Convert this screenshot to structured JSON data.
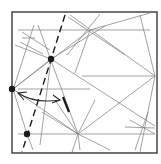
{
  "diagram": {
    "type": "origami-crease-pattern",
    "width": 161,
    "height": 164,
    "colors": {
      "background": "#ffffff",
      "border": "#3a3a3a",
      "crease": "#8a8a8a",
      "mark": "#1a1a1a"
    },
    "square": {
      "x": 12,
      "y": 12,
      "w": 145,
      "h": 141
    },
    "creases": [
      [
        18,
        30,
        150,
        30
      ],
      [
        18,
        89,
        90,
        89
      ],
      [
        82,
        76,
        155,
        76
      ],
      [
        18,
        134,
        155,
        134
      ],
      [
        22,
        38,
        35,
        38
      ],
      [
        22,
        32,
        50,
        50
      ],
      [
        20,
        42,
        43,
        54
      ],
      [
        34,
        25,
        13,
        90
      ],
      [
        38,
        25,
        78,
        134
      ],
      [
        70,
        15,
        155,
        76
      ],
      [
        90,
        30,
        75,
        73
      ],
      [
        100,
        14,
        67,
        55
      ],
      [
        90,
        30,
        150,
        13
      ],
      [
        68,
        17,
        125,
        55
      ],
      [
        13,
        89,
        90,
        30
      ],
      [
        13,
        89,
        78,
        134
      ],
      [
        51,
        59,
        155,
        126
      ],
      [
        13,
        89,
        51,
        59
      ],
      [
        51,
        59,
        40,
        145
      ],
      [
        15,
        45,
        51,
        59
      ],
      [
        51,
        59,
        105,
        26
      ],
      [
        13,
        89,
        27,
        134
      ],
      [
        27,
        134,
        33,
        150
      ],
      [
        78,
        134,
        155,
        76
      ],
      [
        78,
        134,
        110,
        150
      ],
      [
        78,
        134,
        55,
        100
      ],
      [
        78,
        134,
        80,
        150
      ],
      [
        78,
        134,
        72,
        152
      ],
      [
        78,
        134,
        42,
        112
      ],
      [
        78,
        134,
        95,
        100
      ],
      [
        140,
        15,
        155,
        76
      ],
      [
        155,
        76,
        140,
        152
      ],
      [
        130,
        120,
        155,
        134
      ],
      [
        148,
        112,
        135,
        150
      ],
      [
        125,
        127,
        155,
        128
      ]
    ],
    "dashed_line": [
      65,
      15,
      22,
      152
    ],
    "thick_segment": [
      63,
      97,
      69,
      112
    ],
    "arrow": {
      "path": "M 18 93 Q 35 104 60 100",
      "head_start": [
        18,
        93
      ],
      "head_end": [
        60,
        100
      ],
      "style": "double-headed-curved"
    },
    "dots": [
      {
        "name": "upper-reference-point",
        "cx": 51,
        "cy": 59,
        "r": 3.2
      },
      {
        "name": "left-edge-point",
        "cx": 12,
        "cy": 89,
        "r": 3.2
      },
      {
        "name": "lower-reference-point",
        "cx": 27,
        "cy": 134,
        "r": 3.2
      }
    ]
  }
}
